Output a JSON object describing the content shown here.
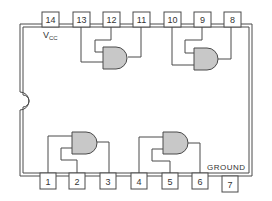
{
  "colors": {
    "line": "#4a4a4a",
    "gate_fill": "#c8c8c8",
    "pin_fill": "#ffffff",
    "background": "#ffffff"
  },
  "labels": {
    "vcc_main": "V",
    "vcc_sub": "CC",
    "ground": "GROUND"
  },
  "top_pins": [
    {
      "number": "14",
      "x": 42
    },
    {
      "number": "13",
      "x": 73
    },
    {
      "number": "12",
      "x": 103
    },
    {
      "number": "11",
      "x": 133
    },
    {
      "number": "10",
      "x": 164
    },
    {
      "number": "9",
      "x": 194
    },
    {
      "number": "8",
      "x": 224
    }
  ],
  "bottom_pins": [
    {
      "number": "1",
      "x": 40
    },
    {
      "number": "2",
      "x": 69
    },
    {
      "number": "3",
      "x": 100
    },
    {
      "number": "4",
      "x": 131
    },
    {
      "number": "5",
      "x": 162
    },
    {
      "number": "6",
      "x": 192
    },
    {
      "number": "7",
      "x": 222
    }
  ],
  "gates": [
    {
      "id": "gate-1",
      "inputs": [
        "13",
        "12"
      ],
      "output": "11"
    },
    {
      "id": "gate-2",
      "inputs": [
        "10",
        "9"
      ],
      "output": "8"
    },
    {
      "id": "gate-3",
      "inputs": [
        "1",
        "2"
      ],
      "output": "3"
    },
    {
      "id": "gate-4",
      "inputs": [
        "4",
        "5"
      ],
      "output": "6"
    }
  ]
}
